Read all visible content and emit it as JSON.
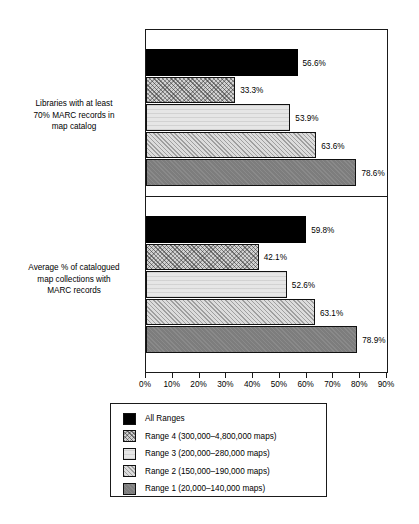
{
  "chart_data": {
    "type": "bar",
    "orientation": "horizontal",
    "title": "",
    "xlabel": "",
    "ylabel": "",
    "xlim": [
      0,
      90
    ],
    "xticks": [
      "0%",
      "10%",
      "20%",
      "30%",
      "40%",
      "50%",
      "60%",
      "70%",
      "80%",
      "90%"
    ],
    "xtick_values": [
      0,
      10,
      20,
      30,
      40,
      50,
      60,
      70,
      80,
      90
    ],
    "grid": false,
    "legend_position": "bottom",
    "categories": [
      "Libraries with at least 70% MARC records in map catalog",
      "Average % of catalogued map collections with MARC records"
    ],
    "series": [
      {
        "name": "All Ranges",
        "values": [
          56.6,
          59.8
        ],
        "labels": [
          "56.6%",
          "59.8%"
        ],
        "fill": "fill-all"
      },
      {
        "name": "Range 4 (300,000–4,800,000 maps)",
        "values": [
          33.3,
          42.1
        ],
        "labels": [
          "33.3%",
          "42.1%"
        ],
        "fill": "fill-r4"
      },
      {
        "name": "Range 3 (200,000–280,000 maps)",
        "values": [
          53.9,
          52.6
        ],
        "labels": [
          "53.9%",
          "52.6%"
        ],
        "fill": "fill-r3"
      },
      {
        "name": "Range 2 (150,000–190,000 maps)",
        "values": [
          63.6,
          63.1
        ],
        "labels": [
          "63.6%",
          "63.1%"
        ],
        "fill": "fill-r2"
      },
      {
        "name": "Range 1 (20,000–140,000 maps)",
        "values": [
          78.6,
          78.9
        ],
        "labels": [
          "78.6%",
          "78.9%"
        ],
        "fill": "fill-r1"
      }
    ]
  },
  "panels": [
    {
      "label_lines": [
        "Libraries with at least",
        "70% MARC records in",
        "map catalog"
      ]
    },
    {
      "label_lines": [
        "Average % of catalogued",
        "map collections with",
        "MARC records"
      ]
    }
  ],
  "legend": {
    "items": [
      {
        "label": "All Ranges",
        "fill": "fill-all"
      },
      {
        "label": "Range 4 (300,000–4,800,000 maps)",
        "fill": "fill-r4"
      },
      {
        "label": "Range 3 (200,000–280,000 maps)",
        "fill": "fill-r3"
      },
      {
        "label": "Range 2 (150,000–190,000 maps)",
        "fill": "fill-r2"
      },
      {
        "label": "Range 1 (20,000–140,000 maps)",
        "fill": "fill-r1"
      }
    ]
  },
  "colors": {
    "axis": "#1a1a1a",
    "all_ranges": "#000000",
    "range4": "#d2d2d2",
    "range3": "#e6e6e6",
    "range2": "#dcdcdc",
    "range1": "#7d7d7d",
    "background": "#ffffff"
  }
}
